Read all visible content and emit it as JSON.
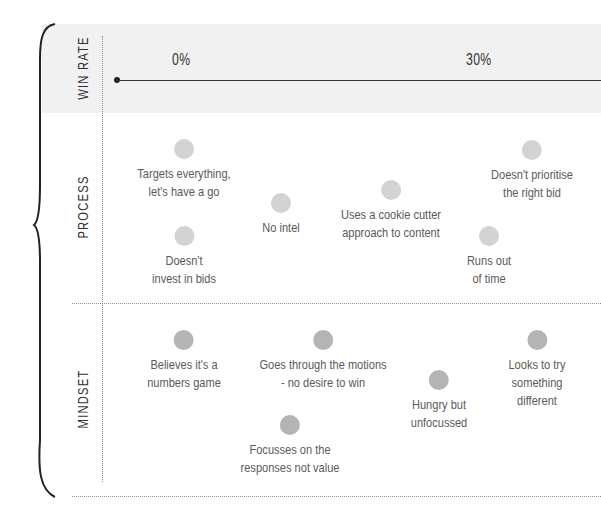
{
  "axis": {
    "row_label": "WIN RATE",
    "ticks": [
      {
        "label": "0%",
        "x": 180
      },
      {
        "label": "30%",
        "x": 478
      }
    ]
  },
  "rows": {
    "process": {
      "label": "PROCESS"
    },
    "mindset": {
      "label": "MINDSET"
    }
  },
  "colors": {
    "band": "#f1f1f1",
    "process_dot": "#d3d3d3",
    "mindset_dot": "#b4b4b4",
    "axis": "#333333"
  },
  "process_items": [
    {
      "text": "Targets everything,\nlet's have a go",
      "x": 184,
      "y": 139
    },
    {
      "text": "Doesn't\ninvest in bids",
      "x": 184,
      "y": 226
    },
    {
      "text": "No intel",
      "x": 281,
      "y": 193
    },
    {
      "text": "Uses a cookie cutter\napproach to content",
      "x": 391,
      "y": 180
    },
    {
      "text": "Doesn't prioritise\nthe right bid",
      "x": 532,
      "y": 140
    },
    {
      "text": "Runs out\nof time",
      "x": 489,
      "y": 226
    }
  ],
  "mindset_items": [
    {
      "text": "Believes it's a\nnumbers game",
      "x": 184,
      "y": 330
    },
    {
      "text": "Goes through the motions\n- no desire to win",
      "x": 323,
      "y": 330
    },
    {
      "text": "Focusses on the\nresponses not value",
      "x": 290,
      "y": 415
    },
    {
      "text": "Hungry but\nunfocussed",
      "x": 439,
      "y": 370
    },
    {
      "text": "Looks to try\nsomething\ndifferent",
      "x": 537,
      "y": 330
    }
  ]
}
